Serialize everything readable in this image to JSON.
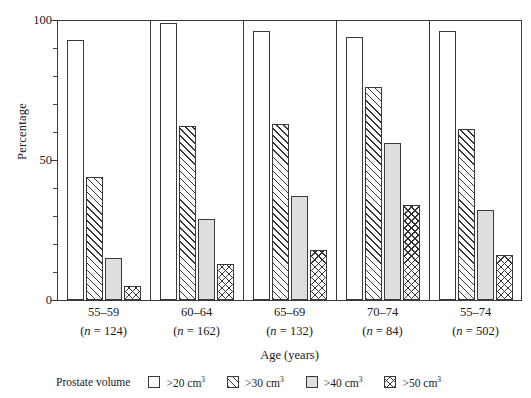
{
  "chart_data": {
    "type": "bar",
    "title": "",
    "xlabel": "Age (years)",
    "ylabel": "Percentage",
    "ylim": [
      0,
      100
    ],
    "yticks": [
      0,
      50,
      100
    ],
    "ytick_labels": [
      "0",
      "50",
      "100"
    ],
    "yminor_step": 10,
    "grid": false,
    "legend_position": "bottom",
    "legend_title": "Prostate volume",
    "categories": [
      "55–59",
      "60–64",
      "65–69",
      "70–74",
      "55–74"
    ],
    "category_sublabels": [
      "(n = 124)",
      "(n = 162)",
      "(n = 132)",
      "(n = 84)",
      "(n = 502)"
    ],
    "category_n": [
      124,
      162,
      132,
      84,
      502
    ],
    "series": [
      {
        "name": ">20 cm3",
        "label": ">20 cm",
        "unit_sup": "3",
        "fill": "plain",
        "values": [
          93,
          99,
          96,
          94,
          96
        ]
      },
      {
        "name": ">30 cm3",
        "label": ">30 cm",
        "unit_sup": "3",
        "fill": "diagonal-hatch",
        "values": [
          44,
          62,
          63,
          76,
          61
        ]
      },
      {
        "name": ">40 cm3",
        "label": ">40 cm",
        "unit_sup": "3",
        "fill": "light-gray",
        "values": [
          15,
          29,
          37,
          56,
          32
        ]
      },
      {
        "name": ">50 cm3",
        "label": ">50 cm",
        "unit_sup": "3",
        "fill": "cross-hatch",
        "values": [
          5,
          13,
          18,
          34,
          16
        ]
      }
    ]
  },
  "axes": {
    "y_title": "Percentage",
    "x_title": "Age (years)",
    "y_tick_labels": [
      "100",
      "50",
      "0"
    ]
  },
  "legend": {
    "title": "Prostate volume",
    "items": [
      {
        "label": ">20 cm",
        "sup": "3",
        "fill": "plain"
      },
      {
        "label": ">30 cm",
        "sup": "3",
        "fill": "diagonal-hatch"
      },
      {
        "label": ">40 cm",
        "sup": "3",
        "fill": "light-gray"
      },
      {
        "label": ">50 cm",
        "sup": "3",
        "fill": "cross-hatch"
      }
    ]
  },
  "colors": {
    "axis": "#3a3a3a",
    "bar_outline": "#3a3a3a",
    "gray_fill": "#dedede",
    "hatch": "#333333",
    "background": "#ffffff",
    "text": "#1a1a1a"
  }
}
